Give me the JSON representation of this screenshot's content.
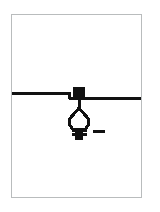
{
  "page": {
    "title": "Pendant Light Fixture Detail",
    "width": 160,
    "height": 212,
    "background_color": "#ffffff"
  },
  "plate": {
    "name": "drawing-plate",
    "border_color": "#b9bcbd",
    "fill_color": "#ffffff",
    "x": 11,
    "y": 14,
    "width": 131,
    "height": 184
  },
  "drawing": {
    "type": "line-drawing",
    "subject": "ceiling mounted pendant lamp symbol",
    "stroke_color": "#111111",
    "fill_color": "#111111",
    "elements": [
      {
        "name": "ceiling-line-left",
        "label": "Ceiling line (left segment)",
        "kind": "horizontal-line",
        "x1": 12,
        "y1": 93,
        "x2": 68,
        "y2": 93,
        "stroke_width": 3
      },
      {
        "name": "ceiling-line-step",
        "label": "Ceiling line step down",
        "kind": "vertical-line",
        "x1": 68,
        "y1": 93,
        "x2": 68,
        "y2": 98,
        "stroke_width": 3
      },
      {
        "name": "ceiling-line-right",
        "label": "Ceiling line (right segment)",
        "kind": "horizontal-line",
        "x1": 68,
        "y1": 98,
        "x2": 141,
        "y2": 98,
        "stroke_width": 3
      },
      {
        "name": "junction-box",
        "label": "Junction box / outlet box",
        "kind": "filled-rect",
        "x": 73,
        "y": 87,
        "width": 12,
        "height": 12
      },
      {
        "name": "drop-stem",
        "label": "Pendant drop stem",
        "kind": "vertical-line",
        "x1": 79,
        "y1": 99,
        "x2": 79,
        "y2": 109,
        "stroke_width": 3
      },
      {
        "name": "shade-spreader-left",
        "label": "Lamp shade spreader (left)",
        "kind": "line",
        "x1": 79,
        "y1": 108,
        "x2": 72,
        "y2": 116,
        "stroke_width": 2
      },
      {
        "name": "shade-spreader-right",
        "label": "Lamp shade spreader (right)",
        "kind": "line",
        "x1": 79,
        "y1": 108,
        "x2": 86,
        "y2": 116,
        "stroke_width": 2
      },
      {
        "name": "lamp-bulb-outline",
        "label": "Lamp bulb / globe outline",
        "kind": "closed-path",
        "stroke_width": 3
      },
      {
        "name": "lamp-base-thread-upper",
        "label": "Screw base thread (upper)",
        "kind": "horizontal-line",
        "x1": 72,
        "y1": 130,
        "x2": 87,
        "y2": 130,
        "stroke_width": 3
      },
      {
        "name": "lamp-base-thread-lower",
        "label": "Screw base thread (lower)",
        "kind": "horizontal-line",
        "x1": 72,
        "y1": 134,
        "x2": 87,
        "y2": 134,
        "stroke_width": 3
      },
      {
        "name": "lamp-base-contact",
        "label": "Base contact block",
        "kind": "filled-rect",
        "x": 75,
        "y": 131,
        "width": 8,
        "height": 9
      },
      {
        "name": "leader-dash",
        "label": "Leader dash mark",
        "kind": "horizontal-line",
        "x1": 93,
        "y1": 131,
        "x2": 105,
        "y2": 131,
        "stroke_width": 3
      }
    ]
  },
  "annotations": {
    "dash_mark_text": "—",
    "visible_text": ""
  },
  "colors": {
    "ink": "#111111",
    "frame": "#b9bcbd",
    "paper": "#ffffff"
  }
}
